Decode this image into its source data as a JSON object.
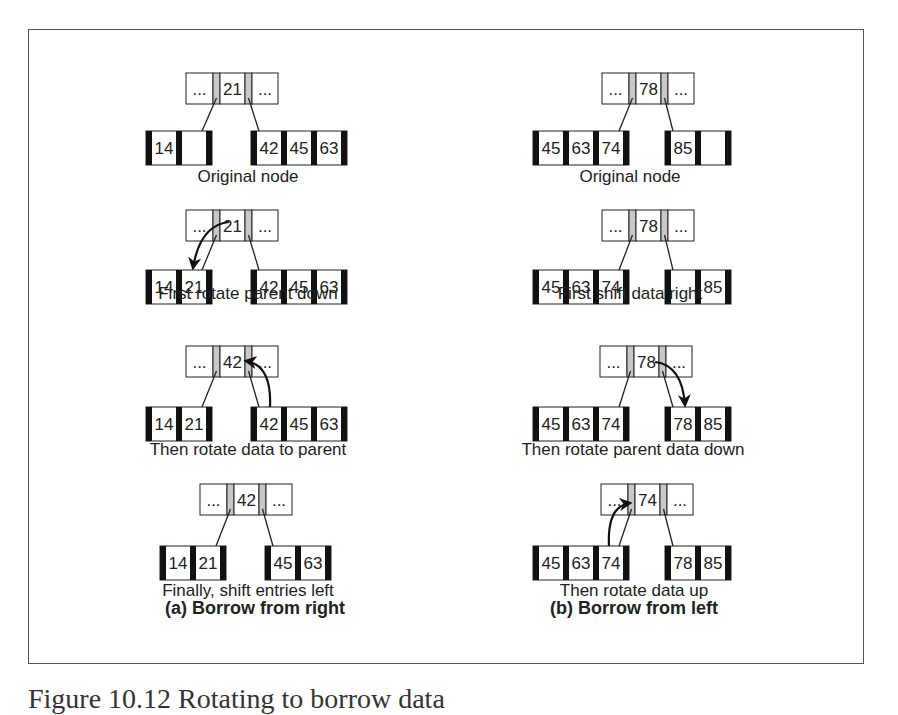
{
  "figure": {
    "caption": "Figure 10.12  Rotating to borrow data",
    "panels": [
      {
        "id": "a",
        "title": "(a) Borrow from right",
        "title_x": 255,
        "title_y": 598,
        "steps": [
          {
            "label": "Original node",
            "label_x": 248,
            "label_y": 170,
            "parent": {
              "x": 186,
              "y": 73,
              "keys": [
                "...",
                "21",
                "..."
              ]
            },
            "left": {
              "x": 146,
              "y": 131,
              "keys": [
                "14",
                ""
              ]
            },
            "right": {
              "x": 251,
              "y": 131,
              "keys": [
                "42",
                "45",
                "63"
              ]
            },
            "arrow": null
          },
          {
            "label": "First rotate parent down",
            "label_x": 248,
            "label_y": 287,
            "parent": {
              "x": 186,
              "y": 210,
              "keys": [
                "...",
                "21",
                "..."
              ]
            },
            "left": {
              "x": 146,
              "y": 270,
              "keys": [
                "14",
                "21"
              ]
            },
            "right": {
              "x": 251,
              "y": 270,
              "keys": [
                "42",
                "45",
                "63"
              ]
            },
            "arrow": {
              "from": [
                229,
                222
              ],
              "ctrl": [
                200,
                225
              ],
              "to": [
                193,
                268
              ]
            }
          },
          {
            "label": "Then rotate data to parent",
            "label_x": 248,
            "label_y": 443,
            "parent": {
              "x": 186,
              "y": 346,
              "keys": [
                "...",
                "42",
                "..."
              ]
            },
            "left": {
              "x": 146,
              "y": 407,
              "keys": [
                "14",
                "21"
              ]
            },
            "right": {
              "x": 251,
              "y": 407,
              "keys": [
                "42",
                "45",
                "63"
              ]
            },
            "arrow": {
              "from": [
                270,
                407
              ],
              "ctrl": [
                272,
                365
              ],
              "to": [
                246,
                361
              ]
            }
          },
          {
            "label": "Finally, shift entries left",
            "label_x": 248,
            "label_y": 584,
            "parent": {
              "x": 200,
              "y": 484,
              "keys": [
                "...",
                "42",
                "..."
              ]
            },
            "left": {
              "x": 160,
              "y": 546,
              "keys": [
                "14",
                "21"
              ]
            },
            "right": {
              "x": 265,
              "y": 546,
              "keys": [
                "45",
                "63"
              ]
            },
            "arrow": null
          }
        ]
      },
      {
        "id": "b",
        "title": "(b) Borrow from left",
        "title_x": 634,
        "title_y": 598,
        "steps": [
          {
            "label": "Original node",
            "label_x": 630,
            "label_y": 170,
            "parent": {
              "x": 602,
              "y": 73,
              "keys": [
                "...",
                "78",
                "..."
              ]
            },
            "left": {
              "x": 533,
              "y": 131,
              "keys": [
                "45",
                "63",
                "74"
              ]
            },
            "right": {
              "x": 665,
              "y": 131,
              "keys": [
                "85",
                ""
              ]
            },
            "arrow": null
          },
          {
            "label": "First shift data right",
            "label_x": 630,
            "label_y": 287,
            "parent": {
              "x": 602,
              "y": 210,
              "keys": [
                "...",
                "78",
                "..."
              ]
            },
            "left": {
              "x": 533,
              "y": 270,
              "keys": [
                "45",
                "63",
                "74"
              ]
            },
            "right": {
              "x": 665,
              "y": 270,
              "keys": [
                "",
                "85"
              ]
            },
            "arrow": null
          },
          {
            "label": "Then rotate parent data down",
            "label_x": 633,
            "label_y": 443,
            "parent": {
              "x": 600,
              "y": 346,
              "keys": [
                "...",
                "78",
                "..."
              ]
            },
            "left": {
              "x": 533,
              "y": 407,
              "keys": [
                "45",
                "63",
                "74"
              ]
            },
            "right": {
              "x": 665,
              "y": 407,
              "keys": [
                "78",
                "85"
              ]
            },
            "arrow": {
              "from": [
                655,
                362
              ],
              "ctrl": [
                682,
                365
              ],
              "to": [
                685,
                405
              ]
            }
          },
          {
            "label": "Then rotate data up",
            "label_x": 634,
            "label_y": 584,
            "parent": {
              "x": 601,
              "y": 484,
              "keys": [
                "...",
                "74",
                "..."
              ]
            },
            "left": {
              "x": 533,
              "y": 546,
              "keys": [
                "45",
                "63",
                "74"
              ]
            },
            "right": {
              "x": 665,
              "y": 546,
              "keys": [
                "78",
                "85"
              ]
            },
            "arrow": {
              "from": [
                609,
                546
              ],
              "ctrl": [
                607,
                506
              ],
              "to": [
                630,
                503
              ]
            }
          }
        ]
      }
    ]
  },
  "colors": {
    "border": "#222222",
    "pointer_fill": "#c8c8c8",
    "leaf_bar": "#111111",
    "text": "#222222",
    "frame": "#555555"
  }
}
